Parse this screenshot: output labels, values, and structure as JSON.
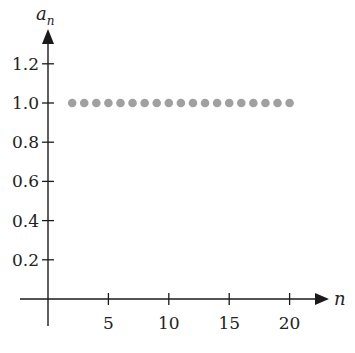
{
  "chart_data": {
    "type": "scatter",
    "title": "",
    "xlabel": "n",
    "ylabel": "a_n",
    "ylabel_main": "a",
    "ylabel_sub": "n",
    "x": [
      2,
      3,
      4,
      5,
      6,
      7,
      8,
      9,
      10,
      11,
      12,
      13,
      14,
      15,
      16,
      17,
      18,
      19,
      20
    ],
    "y": [
      1.0,
      1.0,
      1.0,
      1.0,
      1.0,
      1.0,
      1.0,
      1.0,
      1.0,
      1.0,
      1.0,
      1.0,
      1.0,
      1.0,
      1.0,
      1.0,
      1.0,
      1.0,
      1.0
    ],
    "xticks": [
      5,
      10,
      15,
      20
    ],
    "xtick_labels": [
      "5",
      "10",
      "15",
      "20"
    ],
    "yticks": [
      0.2,
      0.4,
      0.6,
      0.8,
      1.0,
      1.2
    ],
    "ytick_labels": [
      "0.2",
      "0.4",
      "0.6",
      "0.8",
      "1.0",
      "1.2"
    ],
    "xlim": [
      0,
      23
    ],
    "ylim": [
      0,
      1.35
    ],
    "grid": false,
    "legend": null,
    "marker_color": "#a0a0a0",
    "axis_color": "#1a1a1a"
  }
}
